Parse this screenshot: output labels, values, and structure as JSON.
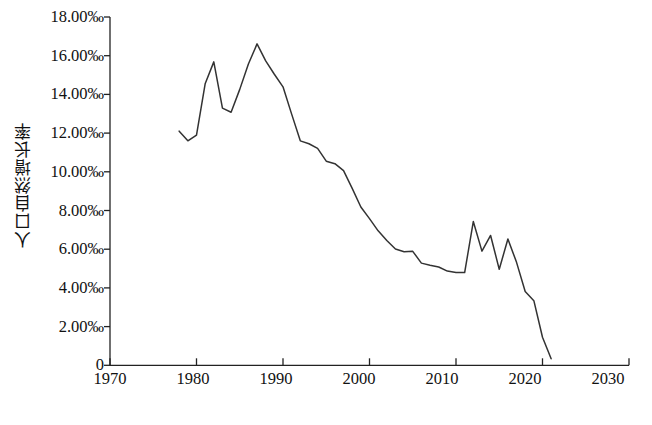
{
  "chart_data": {
    "type": "line",
    "title": "",
    "xlabel": "年份",
    "ylabel": "人口自然增长率",
    "xlim": [
      1970,
      2030
    ],
    "ylim": [
      0,
      18
    ],
    "grid": false,
    "legend": null,
    "xticks": [
      1970,
      1980,
      1990,
      2000,
      2010,
      2020,
      2030
    ],
    "xtick_labels": [
      "1970",
      "1980",
      "1990",
      "2000",
      "2010",
      "2020",
      "2030"
    ],
    "yticks": [
      0,
      2,
      4,
      6,
      8,
      10,
      12,
      14,
      16,
      18
    ],
    "ytick_labels": [
      "0",
      "2.00‰",
      "4.00‰",
      "6.00‰",
      "8.00‰",
      "10.00‰",
      "12.00‰",
      "14.00‰",
      "16.00‰",
      "18.00‰"
    ],
    "unit": "‰",
    "series": [
      {
        "name": "人口自然增长率",
        "color": "#333333",
        "x": [
          1978,
          1979,
          1980,
          1981,
          1982,
          1983,
          1984,
          1985,
          1986,
          1987,
          1988,
          1989,
          1990,
          1991,
          1992,
          1993,
          1994,
          1995,
          1996,
          1997,
          1998,
          1999,
          2000,
          2001,
          2002,
          2003,
          2004,
          2005,
          2006,
          2007,
          2008,
          2009,
          2010,
          2011,
          2012,
          2013,
          2014,
          2015,
          2016,
          2017,
          2018,
          2019,
          2020,
          2021
        ],
        "values": [
          12.1,
          11.6,
          11.9,
          14.55,
          15.68,
          13.29,
          13.08,
          14.26,
          15.57,
          16.61,
          15.73,
          15.04,
          14.39,
          12.98,
          11.6,
          11.45,
          11.21,
          10.55,
          10.42,
          10.06,
          9.14,
          8.18,
          7.58,
          6.95,
          6.45,
          6.01,
          5.87,
          5.89,
          5.28,
          5.17,
          5.08,
          4.87,
          4.79,
          4.79,
          7.43,
          5.9,
          6.71,
          4.96,
          6.53,
          5.32,
          3.81,
          3.34,
          1.45,
          0.34
        ]
      }
    ]
  },
  "axes": {
    "y_title": "人口自然增长率",
    "x_title": "年份"
  }
}
